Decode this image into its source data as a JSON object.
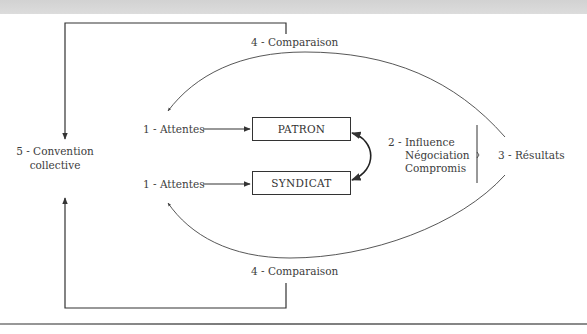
{
  "diagram": {
    "nodes": {
      "convention": {
        "line1": "5 - Convention",
        "line2": "collective"
      },
      "attentes_patron": "1 - Attentes",
      "attentes_syndicat": "1 - Attentes",
      "patron": "PATRON",
      "syndicat": "SYNDICAT",
      "process": {
        "line1": "2 - Influence",
        "line2": "Négociation",
        "line3": "Compromis"
      },
      "resultats": "3 - Résultats",
      "comparaison_top": "4 - Comparaison",
      "comparaison_bottom": "4 - Comparaison"
    },
    "colors": {
      "line": "#333333",
      "text": "#3c3c3c",
      "top_band": "#d6d6d6",
      "bottom_rule": "#858585"
    }
  }
}
